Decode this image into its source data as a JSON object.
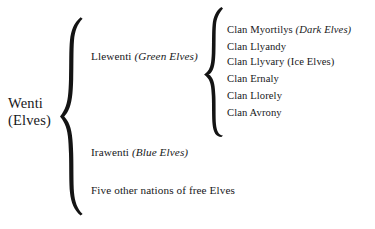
{
  "diagram": {
    "type": "hierarchy-tree",
    "background_color": "#ffffff",
    "text_color": "#17181a",
    "brace_color": "#141414",
    "root": {
      "line1": "Wenti",
      "line2": "(Elves)"
    },
    "branches": [
      {
        "name": "Llewenti",
        "qualifier": "(Green Elves)",
        "qualifier_style": "italic"
      },
      {
        "name": "Irawenti",
        "qualifier": "(Blue Elves)",
        "qualifier_style": "italic"
      },
      {
        "name": "Five other nations of free Elves",
        "qualifier": "",
        "qualifier_style": "none"
      }
    ],
    "clans": [
      {
        "name": "Clan Myortilys",
        "qualifier": "(Dark Elves)",
        "qualifier_style": "italic"
      },
      {
        "name": "Clan Llyandy",
        "qualifier": "",
        "qualifier_style": "none"
      },
      {
        "name": "Clan Llyvary",
        "qualifier": "(Ice Elves)",
        "qualifier_style": "roman"
      },
      {
        "name": "Clan Ernaly",
        "qualifier": "",
        "qualifier_style": "none"
      },
      {
        "name": "Clan Llorely",
        "qualifier": "",
        "qualifier_style": "none"
      },
      {
        "name": "Clan Avrony",
        "qualifier": "",
        "qualifier_style": "none"
      }
    ]
  }
}
